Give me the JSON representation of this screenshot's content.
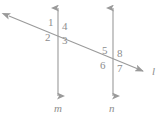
{
  "figure": {
    "type": "geometry-diagram",
    "stroke_color": "#9a9a9a",
    "label_color": "#8d8d8d",
    "background_color": "#ffffff"
  },
  "lines": [
    {
      "name": "line-m",
      "label": "m",
      "orientation": "vertical",
      "x": 58,
      "y_top": 4,
      "y_bottom": 100,
      "arrow_top": true,
      "arrow_bottom": true,
      "label_x": 54,
      "label_y": 104
    },
    {
      "name": "line-n",
      "label": "n",
      "orientation": "vertical",
      "x": 113,
      "y_top": 4,
      "y_bottom": 100,
      "arrow_top": true,
      "arrow_bottom": true,
      "label_x": 109,
      "label_y": 104
    },
    {
      "name": "line-l",
      "label": "l",
      "orientation": "transversal",
      "x_start": 4,
      "y_start": 14,
      "x_end": 148,
      "y_end": 73,
      "arrow_start": true,
      "arrow_end": true,
      "label_x": 152,
      "label_y": 70
    }
  ],
  "intersections": [
    {
      "name": "intersection-m-l",
      "x": 58,
      "y": 30
    },
    {
      "name": "intersection-n-l",
      "x": 113,
      "y": 58
    }
  ],
  "angles": [
    {
      "id": "angle-1",
      "label": "1",
      "x": 48,
      "y": 17,
      "intersection": "intersection-m-l",
      "position": "upper-left"
    },
    {
      "id": "angle-2",
      "label": "2",
      "x": 45,
      "y": 32,
      "intersection": "intersection-m-l",
      "position": "lower-left"
    },
    {
      "id": "angle-3",
      "label": "3",
      "x": 62,
      "y": 35,
      "intersection": "intersection-m-l",
      "position": "lower-right"
    },
    {
      "id": "angle-4",
      "label": "4",
      "x": 62,
      "y": 21,
      "intersection": "intersection-m-l",
      "position": "upper-right"
    },
    {
      "id": "angle-5",
      "label": "5",
      "x": 102,
      "y": 45,
      "intersection": "intersection-n-l",
      "position": "upper-left"
    },
    {
      "id": "angle-6",
      "label": "6",
      "x": 100,
      "y": 60,
      "intersection": "intersection-n-l",
      "position": "lower-left"
    },
    {
      "id": "angle-7",
      "label": "7",
      "x": 117,
      "y": 63,
      "intersection": "intersection-n-l",
      "position": "lower-right"
    },
    {
      "id": "angle-8",
      "label": "8",
      "x": 117,
      "y": 48,
      "intersection": "intersection-n-l",
      "position": "upper-right"
    }
  ]
}
